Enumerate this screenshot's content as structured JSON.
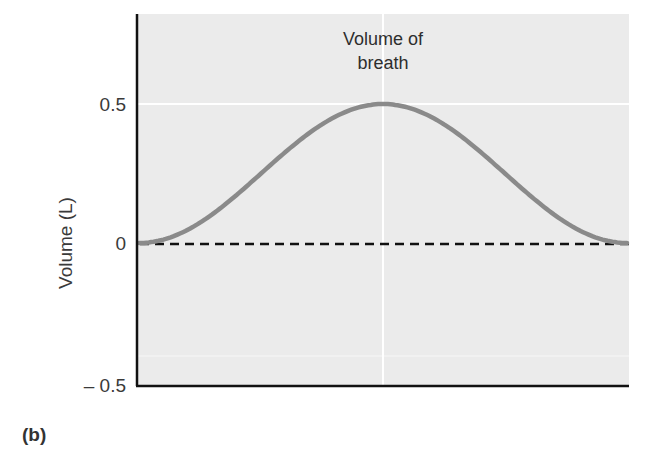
{
  "panel_label": "(b)",
  "chart_data": {
    "type": "line",
    "title": "",
    "annotation": [
      "Volume of",
      "breath"
    ],
    "xlabel": "",
    "ylabel": "Volume (L)",
    "ylim": [
      -0.5,
      0.8
    ],
    "yticks": [
      {
        "value": 0.5,
        "label": "0.5"
      },
      {
        "value": 0,
        "label": "0"
      },
      {
        "value": -0.5,
        "label": "– 0.5"
      }
    ],
    "grid": {
      "horizontal_at": [
        0.5,
        -0.4
      ],
      "vertical_at_fraction": 0.5
    },
    "reference_line": {
      "value": 0,
      "style": "dashed",
      "color": "#111111"
    },
    "series": [
      {
        "name": "Volume of breath",
        "color": "#8a8a8a",
        "x": [
          0,
          0.05,
          0.1,
          0.15,
          0.2,
          0.25,
          0.3,
          0.35,
          0.4,
          0.45,
          0.5,
          0.55,
          0.6,
          0.65,
          0.7,
          0.75,
          0.8,
          0.85,
          0.9,
          0.95,
          1.0
        ],
        "values": [
          0,
          0.006,
          0.024,
          0.053,
          0.091,
          0.136,
          0.188,
          0.243,
          0.3,
          0.355,
          0.5,
          0.355,
          0.3,
          0.243,
          0.188,
          0.136,
          0.091,
          0.053,
          0.024,
          0.006,
          0
        ],
        "shape": "raised cosine (0 → 0.5 peak at midpoint → 0)"
      }
    ],
    "background_color": "#ebebeb"
  }
}
